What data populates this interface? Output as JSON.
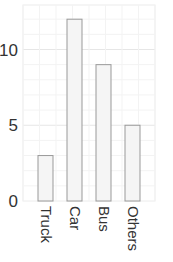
{
  "chart_data": {
    "type": "bar",
    "title": "",
    "xlabel": "",
    "ylabel": "",
    "categories": [
      "Truck",
      "Car",
      "Bus",
      "Others"
    ],
    "values": [
      3,
      12,
      9,
      5
    ],
    "ylim": [
      0,
      13
    ],
    "yticks": [
      0,
      5,
      10
    ],
    "ytick_labels": [
      "0",
      "5",
      "10"
    ],
    "grid": true,
    "legend": null,
    "bar_fill": "#f5f5f5",
    "bar_stroke": "#999999",
    "xtick_rotation": 90
  }
}
